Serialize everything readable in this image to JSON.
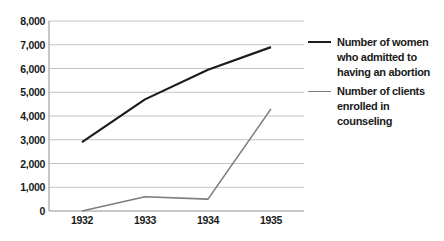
{
  "chart_data": {
    "type": "line",
    "title": "",
    "xlabel": "",
    "ylabel": "",
    "x_categories": [
      "1932",
      "1933",
      "1934",
      "1935"
    ],
    "series": [
      {
        "name": "Number of women who admitted to having an abortion",
        "values": [
          2900,
          4700,
          5950,
          6900
        ],
        "color": "#1c1c1c"
      },
      {
        "name": "Number of clients enrolled in counseling",
        "values": [
          0,
          600,
          500,
          4300
        ],
        "color": "#7d7d7d"
      }
    ],
    "ylim": [
      0,
      8000
    ],
    "ytick_step": 1000,
    "ytick_labels": [
      "0",
      "1,000",
      "2,000",
      "3,000",
      "4,000",
      "5,000",
      "6,000",
      "7,000",
      "8,000"
    ],
    "grid": "horizontal",
    "legend_position": "right"
  },
  "legend": {
    "items": [
      {
        "label_lines": [
          "Number of women",
          "who admitted to",
          "having an abortion"
        ],
        "color": "#1c1c1c"
      },
      {
        "label_lines": [
          "Number of clients",
          "enrolled in counseling"
        ],
        "color": "#7d7d7d"
      }
    ]
  },
  "colors": {
    "background": "#ffffff",
    "gridline": "#c4c4c4",
    "axis": "#8f8f8f",
    "text": "#1a1a1a"
  }
}
